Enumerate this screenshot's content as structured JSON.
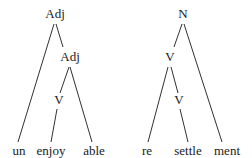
{
  "trees": [
    {
      "name": "unenjoyable",
      "nodes": {
        "root": "Adj",
        "inner": "Adj",
        "verb": "V"
      },
      "leaves": [
        "un",
        "enjoy",
        "able"
      ]
    },
    {
      "name": "resettlement",
      "nodes": {
        "root": "N",
        "inner": "V",
        "verb": "V"
      },
      "leaves": [
        "re",
        "settle",
        "ment"
      ]
    }
  ],
  "colors": {
    "line": "#1a1a1a",
    "background": "#ffffff"
  }
}
